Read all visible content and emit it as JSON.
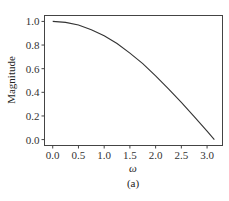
{
  "chart_data": {
    "type": "line",
    "title": "",
    "xlabel": "ω",
    "ylabel": "Magnitude",
    "caption": "(a)",
    "xlim": [
      -0.16,
      3.3
    ],
    "ylim": [
      -0.05,
      1.05
    ],
    "xticks": [
      0.0,
      0.5,
      1.0,
      1.5,
      2.0,
      2.5,
      3.0
    ],
    "xtick_labels": [
      "0.0",
      "0.5",
      "1.0",
      "1.5",
      "2.0",
      "2.5",
      "3.0"
    ],
    "yticks": [
      0.0,
      0.2,
      0.4,
      0.6,
      0.8,
      1.0
    ],
    "ytick_labels": [
      "0.0",
      "0.2",
      "0.4",
      "0.6",
      "0.8",
      "1.0"
    ],
    "grid": false,
    "legend": null,
    "series": [
      {
        "name": "magnitude",
        "color": "#333333",
        "x": [
          0.0,
          0.25,
          0.5,
          0.75,
          1.0,
          1.25,
          1.5,
          1.75,
          2.0,
          2.25,
          2.5,
          2.75,
          3.0,
          3.1416
        ],
        "y": [
          1.0,
          0.992,
          0.969,
          0.93,
          0.878,
          0.813,
          0.732,
          0.643,
          0.54,
          0.43,
          0.315,
          0.195,
          0.071,
          0.0
        ]
      }
    ]
  }
}
